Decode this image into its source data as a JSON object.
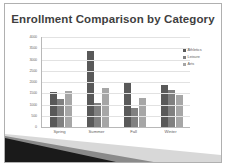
{
  "slide": {
    "title": "Enrollment Comparison by Category",
    "background_color": "#ffffff",
    "border_color": "#b0b0b0",
    "wedge_dark_color": "#1a1a1a",
    "wedge_mid_color": "#8a8a8a",
    "wedge_light_color": "#d8d8d8"
  },
  "chart_data": {
    "type": "bar",
    "title": "Enrollment Comparison by Category",
    "xlabel": "",
    "ylabel": "",
    "categories": [
      "Spring",
      "Summer",
      "Fall",
      "Winter"
    ],
    "series": [
      {
        "name": "Athletics",
        "color": "#595959",
        "values": [
          1560,
          3400,
          1950,
          1880
        ]
      },
      {
        "name": "Leisure",
        "color": "#808080",
        "values": [
          1230,
          1050,
          830,
          1660
        ]
      },
      {
        "name": "Arts",
        "color": "#a6a6a6",
        "values": [
          1610,
          1750,
          1280,
          1430
        ]
      }
    ],
    "ylim": [
      0,
      4000
    ],
    "yticks": [
      4000,
      3500,
      3000,
      2500,
      2000,
      1500,
      1000,
      500,
      0
    ],
    "ytick_labels": [
      "4000",
      "3500",
      "3000",
      "2500",
      "2000",
      "1500",
      "1000",
      "500",
      "0"
    ],
    "grid": true,
    "legend_position": "right"
  }
}
